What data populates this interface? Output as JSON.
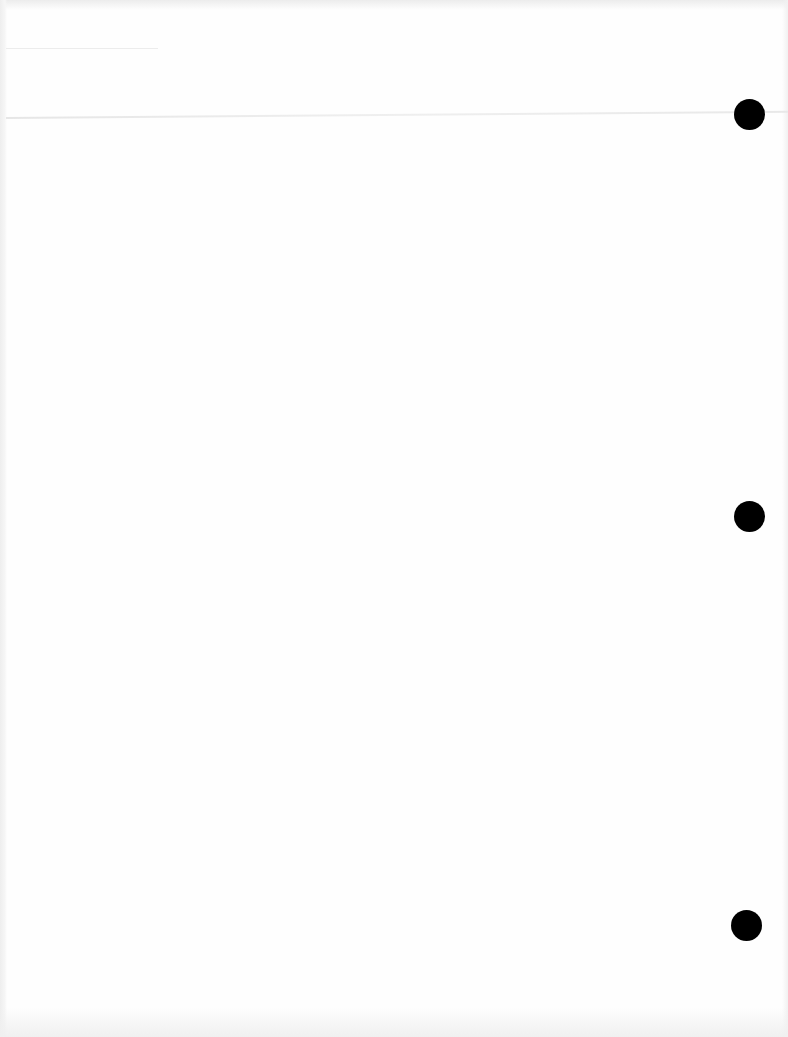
{
  "document": {
    "type": "blank scanned page",
    "background_color": "#fefefe",
    "text_content": "",
    "punch_holes": [
      {
        "cx": 749,
        "cy": 114,
        "diameter": 31,
        "color": "#000000"
      },
      {
        "cx": 749,
        "cy": 516,
        "diameter": 31,
        "color": "#000000"
      },
      {
        "cx": 746,
        "cy": 925,
        "diameter": 31,
        "color": "#000000"
      }
    ]
  }
}
